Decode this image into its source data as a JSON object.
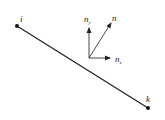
{
  "diagram": {
    "title": "",
    "segment": {
      "start_label": "i",
      "end_label": "k",
      "start": [
        17,
        26
      ],
      "end": [
        148,
        108
      ]
    },
    "vectors": {
      "origin": [
        89,
        58
      ],
      "n": {
        "label": "n",
        "tip": [
          112,
          22
        ]
      },
      "n_y": {
        "label": "n",
        "subscript": "y",
        "tip": [
          89,
          27
        ]
      },
      "n_x": {
        "label": "n",
        "subscript": "x",
        "tip": [
          111,
          58
        ]
      }
    },
    "colors": {
      "line": "#222222",
      "background": "#ffffff"
    }
  }
}
